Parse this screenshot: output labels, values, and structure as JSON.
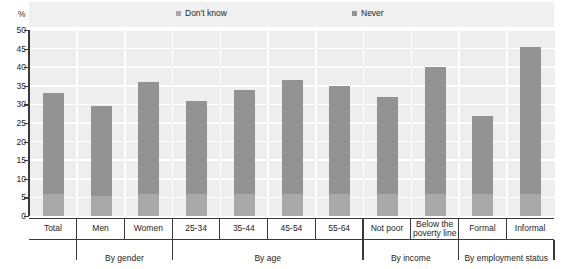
{
  "axis": {
    "unit_label": "%",
    "y_ticks": [
      0,
      5,
      10,
      15,
      20,
      25,
      30,
      35,
      40,
      45,
      50
    ]
  },
  "legend": {
    "items": [
      {
        "label": "Don't know",
        "color": "#a9a9a9",
        "icon": "square-swatch-icon"
      },
      {
        "label": "Never",
        "color": "#939393",
        "icon": "square-swatch-icon"
      }
    ]
  },
  "groups": [
    {
      "label": "",
      "span": 1
    },
    {
      "label": "By gender",
      "span": 2
    },
    {
      "label": "By age",
      "span": 4
    },
    {
      "label": "By income",
      "span": 2
    },
    {
      "label": "By employment status",
      "span": 2
    }
  ],
  "chart_data": {
    "type": "bar",
    "title": "",
    "subtitle": "",
    "xlabel": "",
    "ylabel": "%",
    "ylim": [
      0,
      50
    ],
    "ytick_step": 5,
    "grid": true,
    "legend_position": "top",
    "stacked": true,
    "categories": [
      "Total",
      "Men",
      "Women",
      "25-34",
      "35-44",
      "45-54",
      "55-64",
      "Not poor",
      "Below the poverty line",
      "Formal",
      "Informal"
    ],
    "series": [
      {
        "name": "Never",
        "color": "#939393",
        "values": [
          27,
          24,
          30,
          25,
          28,
          30.5,
          29,
          26,
          34,
          21,
          39.5
        ]
      },
      {
        "name": "Don't know",
        "color": "#a9a9a9",
        "values": [
          6,
          5.5,
          6,
          6,
          6,
          6,
          6,
          6,
          6,
          6,
          6
        ]
      }
    ],
    "totals": [
      33,
      29.5,
      36,
      31,
      34,
      36.5,
      35,
      32,
      40,
      27,
      45.5
    ]
  }
}
